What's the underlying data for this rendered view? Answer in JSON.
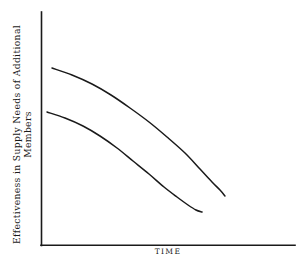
{
  "figure": {
    "background_color": "#ffffff",
    "ink_color": "#1a1a1a",
    "axis_color": "#1a1a1a"
  },
  "axes": {
    "y_title_line1": "Effectiveness in Supply Needs of Additional",
    "y_title_line2": "Members",
    "x_title": "TIME",
    "y_axis_label": "Effectiveness in Supply Needs of Additional Members"
  },
  "chart_data": {
    "type": "line",
    "title": "",
    "subtitle": "",
    "xlabel": "TIME",
    "ylabel": "Effectiveness in Supply Needs of Additional Members",
    "xlim": [
      0,
      100
    ],
    "ylim": [
      0,
      100
    ],
    "grid": false,
    "legend": "none",
    "axis_ticks": {
      "x": [],
      "y": []
    },
    "annotations": [],
    "series": [
      {
        "name": "upper-curve",
        "color": "#1a1a1a",
        "x": [
          6,
          14,
          22,
          30,
          38,
          46,
          54,
          62,
          70,
          78,
          86,
          93
        ],
        "y": [
          75,
          73,
          70,
          66,
          61,
          55,
          49,
          42,
          35,
          28,
          21,
          16
        ],
        "points_px": [
          [
            52,
            68
          ],
          [
            72,
            75
          ],
          [
            92,
            84
          ],
          [
            111,
            95
          ],
          [
            130,
            108
          ],
          [
            149,
            122
          ],
          [
            167,
            137
          ],
          [
            185,
            153
          ],
          [
            200,
            169
          ],
          [
            212,
            182
          ],
          [
            220,
            190
          ],
          [
            225,
            196
          ]
        ]
      },
      {
        "name": "lower-curve",
        "color": "#1a1a1a",
        "x": [
          3,
          11,
          19,
          27,
          35,
          43,
          51,
          59,
          66,
          73,
          79,
          84
        ],
        "y": [
          57,
          55,
          52,
          48,
          44,
          39,
          34,
          28,
          22,
          17,
          13,
          10
        ],
        "points_px": [
          [
            47,
            112
          ],
          [
            65,
            118
          ],
          [
            83,
            126
          ],
          [
            100,
            136
          ],
          [
            117,
            148
          ],
          [
            133,
            161
          ],
          [
            149,
            174
          ],
          [
            164,
            187
          ],
          [
            177,
            197
          ],
          [
            188,
            205
          ],
          [
            196,
            210
          ],
          [
            202,
            212
          ]
        ]
      }
    ]
  }
}
